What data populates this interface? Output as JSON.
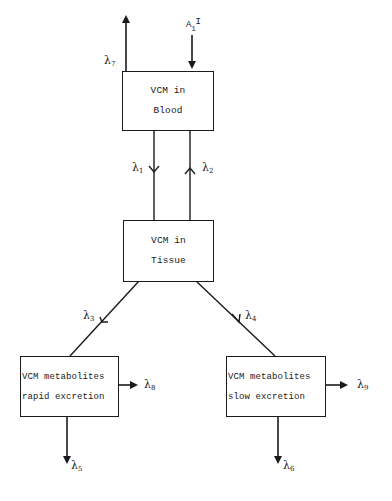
{
  "diagram": {
    "type": "compartmental-model",
    "compartments": [
      {
        "id": "blood",
        "line1": "VCM in",
        "line2": "Blood"
      },
      {
        "id": "tissue",
        "line1": "VCM in",
        "line2": "Tissue"
      },
      {
        "id": "rapid",
        "line1": "VCM metabolites",
        "line2": "rapid excretion"
      },
      {
        "id": "slow",
        "line1": "VCM metabolites",
        "line2": "slow excretion"
      }
    ],
    "input": {
      "label_main": "A",
      "label_sub": "1",
      "label_sup": "I",
      "target": "blood"
    },
    "rates": {
      "l1": {
        "symbol": "λ",
        "sub": "1",
        "from": "blood",
        "to": "tissue"
      },
      "l2": {
        "symbol": "λ",
        "sub": "2",
        "from": "tissue",
        "to": "blood"
      },
      "l3": {
        "symbol": "λ",
        "sub": "3",
        "from": "tissue",
        "to": "rapid"
      },
      "l4": {
        "symbol": "λ",
        "sub": "4",
        "from": "tissue",
        "to": "slow"
      },
      "l5": {
        "symbol": "λ",
        "sub": "5",
        "from": "rapid",
        "to": "out"
      },
      "l6": {
        "symbol": "λ",
        "sub": "6",
        "from": "slow",
        "to": "out"
      },
      "l7": {
        "symbol": "λ",
        "sub": "7",
        "from": "blood",
        "to": "out"
      },
      "l8": {
        "symbol": "λ",
        "sub": "8",
        "from": "rapid",
        "to": "out"
      },
      "l9": {
        "symbol": "λ",
        "sub": "9",
        "from": "slow",
        "to": "out"
      }
    },
    "colors": {
      "line": "#1a1a1a",
      "background": "#ffffff"
    }
  }
}
